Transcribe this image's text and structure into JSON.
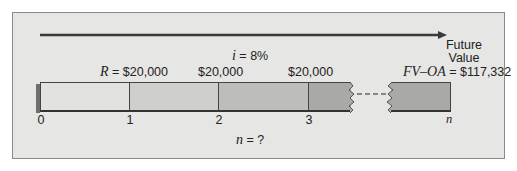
{
  "diagram": {
    "interest_rate_label": {
      "var": "i",
      "eq": " = 8%"
    },
    "payment_labels": [
      {
        "var": "R",
        "text": " = $20,000"
      },
      {
        "var": "",
        "text": "$20,000"
      },
      {
        "var": "",
        "text": "$20,000"
      }
    ],
    "future_value": {
      "line1": "Future",
      "line2": "Value",
      "var": "FV–OA",
      "eq": " = $117,332"
    },
    "periods": [
      "0",
      "1",
      "2",
      "3",
      "n"
    ],
    "periods_question": {
      "var": "n",
      "eq": " = ?"
    },
    "colors": {
      "panel_bg": "#e6e6e4",
      "seg_0_1": "#e2e2e0",
      "seg_1_2": "#cfcfcd",
      "seg_2_3": "#bdbdbb",
      "seg_3_n": "#a9a9a7",
      "shadow": "#6f6f6f",
      "arrow": "#3a3a3a"
    }
  }
}
